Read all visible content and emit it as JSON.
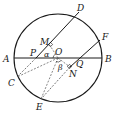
{
  "diagram": {
    "type": "geometry-circle",
    "circle": {
      "center": "O",
      "cx": 58,
      "cy": 58,
      "r": 44
    },
    "points": {
      "A": {
        "x": 14,
        "y": 58,
        "label": "A"
      },
      "B": {
        "x": 102,
        "y": 58,
        "label": "B"
      },
      "O": {
        "x": 58,
        "y": 58,
        "label": "O"
      },
      "D": {
        "x": 79,
        "y": 12,
        "label": "D"
      },
      "C": {
        "x": 17,
        "y": 77,
        "label": "C"
      },
      "F": {
        "x": 100,
        "y": 40,
        "label": "F"
      },
      "E": {
        "x": 41,
        "y": 99,
        "label": "E"
      },
      "M": {
        "x": 49,
        "y": 44,
        "label": "M"
      },
      "P": {
        "x": 36,
        "y": 58,
        "label": "P"
      },
      "Q": {
        "x": 79,
        "y": 58,
        "label": "Q"
      },
      "N": {
        "x": 70,
        "y": 67,
        "label": "N"
      }
    },
    "angles": {
      "alpha": "α",
      "beta": "β"
    },
    "solid_segments": [
      "AB",
      "DM",
      "MP",
      "FQ",
      "QN"
    ],
    "dashed_segments": [
      "PC",
      "NE",
      "OM",
      "ON",
      "OC",
      "OE"
    ],
    "right_angles": [
      "M",
      "N"
    ]
  }
}
